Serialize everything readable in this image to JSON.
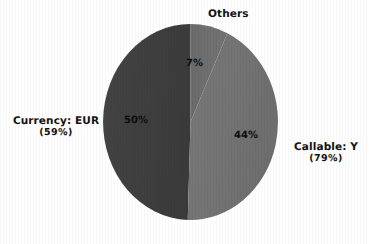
{
  "chart_data": {
    "type": "pie",
    "title": "",
    "start_angle_deg": 90,
    "direction": "clockwise",
    "grid": false,
    "legend_position": "none",
    "categories": [
      "Others",
      "Callable: Y",
      "Currency: EUR"
    ],
    "values": [
      7,
      44,
      50
    ],
    "slice_labels": [
      "7%",
      "44%",
      "50%"
    ],
    "outer_labels": [
      "Others",
      "Callable: Y",
      "Currency: EUR"
    ],
    "outer_sublabels": [
      "",
      "(79%)",
      "(59%)"
    ],
    "colors": [
      "#6e6e6e",
      "#737373",
      "#3e3e3e"
    ],
    "series": [
      {
        "name": "share",
        "values": [
          7,
          44,
          50
        ]
      }
    ],
    "annotations": []
  },
  "chart": {
    "slices": {
      "others": {
        "name": "Others",
        "percent_label": "7%",
        "value": 7,
        "color": "#6e6e6e"
      },
      "callable": {
        "name": "Callable: Y",
        "percent_label": "44%",
        "value": 44,
        "color": "#737373"
      },
      "currency": {
        "name": "Currency: EUR",
        "percent_label": "50%",
        "value": 50,
        "color": "#3e3e3e"
      }
    },
    "labels": {
      "others_title": "Others",
      "callable_title": "Callable: Y",
      "callable_sub": "(79%)",
      "currency_title": "Currency: EUR",
      "currency_sub": "(59%)"
    },
    "background_color": "#ffffff",
    "text_color": "#121212"
  }
}
